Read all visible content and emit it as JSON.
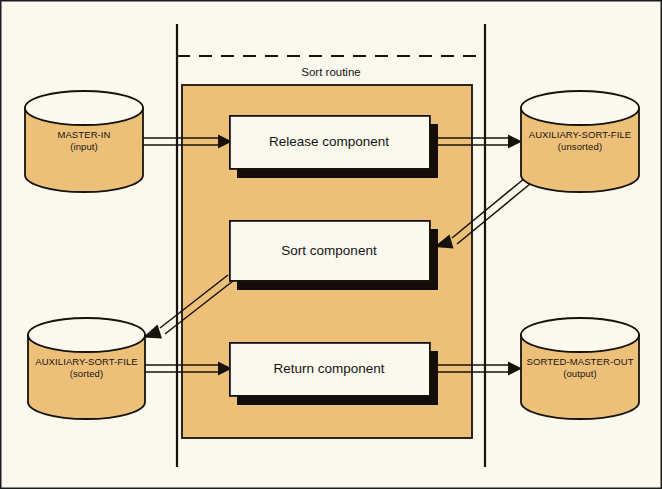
{
  "diagram": {
    "title": "Sort routine",
    "background_color": "#fbf8ee",
    "cylinder_fill": "#edc07a",
    "box_fill": "#fbf8ee",
    "stroke_color": "#17120c",
    "shadow_color": "#120d08",
    "boundary": {
      "label": "Sort routine",
      "left_line_x": 177,
      "right_line_x": 485,
      "dashed_line_y": 56
    },
    "datastores": [
      {
        "id": "master-in",
        "name": "MASTER-IN",
        "qualifier": "(input)",
        "position": "top-left"
      },
      {
        "id": "auxiliary-sort-file-unsorted",
        "name": "AUXILIARY-SORT-FILE",
        "qualifier": "(unsorted)",
        "position": "top-right"
      },
      {
        "id": "auxiliary-sort-file-sorted",
        "name": "AUXILIARY-SORT-FILE",
        "qualifier": "(sorted)",
        "position": "bottom-left"
      },
      {
        "id": "sorted-master-out",
        "name": "SORTED-MASTER-OUT",
        "qualifier": "(output)",
        "position": "bottom-right"
      }
    ],
    "components": [
      {
        "id": "release-component",
        "label": "Release component"
      },
      {
        "id": "sort-component",
        "label": "Sort component"
      },
      {
        "id": "return-component",
        "label": "Return component"
      }
    ],
    "flows": [
      {
        "id": "flow-master-in-to-release",
        "from": "master-in",
        "to": "release-component",
        "style": "straight"
      },
      {
        "id": "flow-release-to-aux-unsorted",
        "from": "release-component",
        "to": "auxiliary-sort-file-unsorted",
        "style": "straight"
      },
      {
        "id": "flow-aux-unsorted-to-sort",
        "from": "auxiliary-sort-file-unsorted",
        "to": "sort-component",
        "style": "diagonal"
      },
      {
        "id": "flow-sort-to-aux-sorted",
        "from": "sort-component",
        "to": "auxiliary-sort-file-sorted",
        "style": "diagonal"
      },
      {
        "id": "flow-aux-sorted-to-return",
        "from": "auxiliary-sort-file-sorted",
        "to": "return-component",
        "style": "straight"
      },
      {
        "id": "flow-return-to-sorted-master-out",
        "from": "return-component",
        "to": "sorted-master-out",
        "style": "straight"
      }
    ]
  }
}
